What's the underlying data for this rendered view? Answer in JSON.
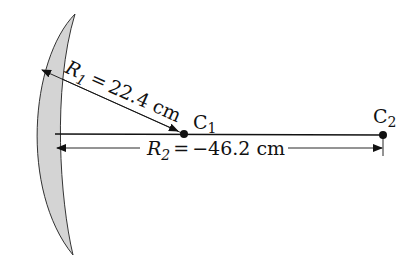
{
  "diagram": {
    "type": "meniscus-lens-radii",
    "lens": {
      "fill": "#d4d4d4",
      "stroke": "#333333"
    },
    "r1": {
      "symbol": "R",
      "subscript": "1",
      "equals": "=",
      "value": "22.4 cm"
    },
    "r2": {
      "symbol": "R",
      "subscript": "2",
      "equals": "=",
      "value": "−46.2 cm"
    },
    "c1": {
      "letter": "C",
      "subscript": "1"
    },
    "c2": {
      "letter": "C",
      "subscript": "2"
    }
  }
}
